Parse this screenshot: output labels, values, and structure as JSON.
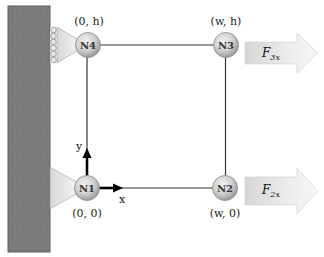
{
  "diagram": {
    "type": "truss-frame",
    "wall": {
      "color": "#7a7a7a",
      "border": "#5a5a5a"
    },
    "nodes": [
      {
        "id": "N1",
        "label": "N1",
        "coord": "(0, 0)",
        "cx": 87,
        "cy": 188
      },
      {
        "id": "N2",
        "label": "N2",
        "coord": "(w, 0)",
        "cx": 225,
        "cy": 188
      },
      {
        "id": "N3",
        "label": "N3",
        "coord": "(w, h)",
        "cx": 226,
        "cy": 45
      },
      {
        "id": "N4",
        "label": "N4",
        "coord": "(0, h)",
        "cx": 88,
        "cy": 45
      }
    ],
    "members": [
      {
        "from": "N1",
        "to": "N2"
      },
      {
        "from": "N2",
        "to": "N3"
      },
      {
        "from": "N3",
        "to": "N4"
      },
      {
        "from": "N4",
        "to": "N1"
      }
    ],
    "supports": [
      {
        "node": "N1",
        "type": "pin"
      },
      {
        "node": "N4",
        "type": "roller"
      }
    ],
    "axes": {
      "x_label": "x",
      "y_label": "y"
    },
    "forces": [
      {
        "id": "F3x",
        "main": "F",
        "sub": "3x",
        "node": "N3",
        "direction": "+x"
      },
      {
        "id": "F2x",
        "main": "F",
        "sub": "2x",
        "node": "N2",
        "direction": "+x"
      }
    ],
    "colors": {
      "node_fill_light": "#e6e6e6",
      "node_fill_dark": "#a8a8a8",
      "member": "#333333",
      "arrow_light": "#f4f4f4",
      "arrow_dark": "#cfcfcf",
      "support_light": "#f2f2f2",
      "support_dark": "#d4d4d4"
    }
  }
}
